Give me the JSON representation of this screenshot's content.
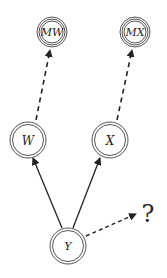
{
  "diagram": {
    "nodes": [
      {
        "id": "MW",
        "label": "MW",
        "style": "triple-circle"
      },
      {
        "id": "MX",
        "label": "MX",
        "style": "triple-circle"
      },
      {
        "id": "W",
        "label": "W",
        "style": "double-circle"
      },
      {
        "id": "X",
        "label": "X",
        "style": "double-circle"
      },
      {
        "id": "Y",
        "label": "Y",
        "style": "double-circle"
      }
    ],
    "edges": [
      {
        "from": "W",
        "to": "MW",
        "style": "dashed"
      },
      {
        "from": "X",
        "to": "MX",
        "style": "dashed"
      },
      {
        "from": "Y",
        "to": "W",
        "style": "solid"
      },
      {
        "from": "Y",
        "to": "X",
        "style": "solid"
      },
      {
        "from": "Y",
        "to": "?",
        "style": "dashed"
      }
    ],
    "unknown_label": "?"
  }
}
